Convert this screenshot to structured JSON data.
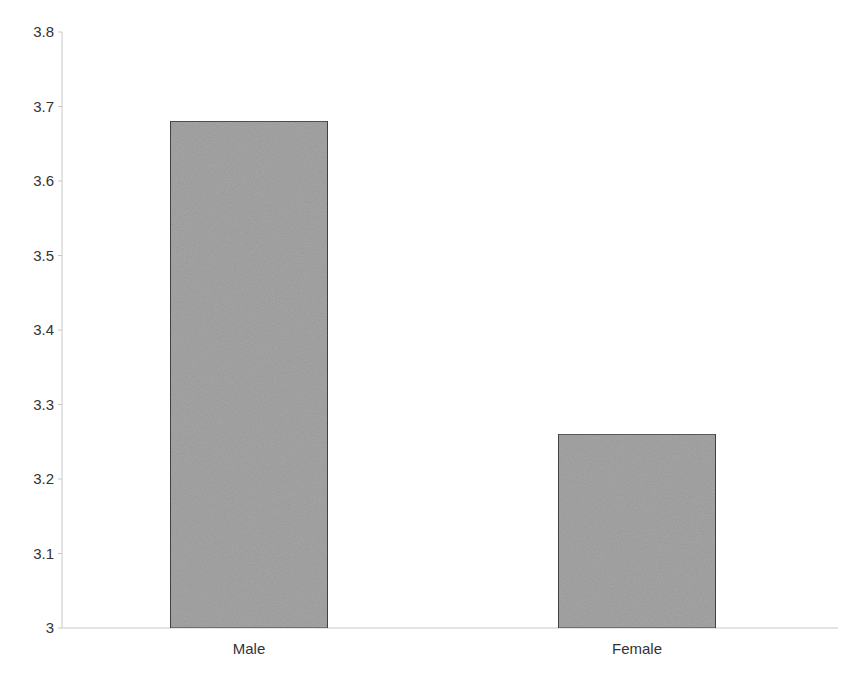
{
  "chart_data": {
    "type": "bar",
    "title": "",
    "xlabel": "",
    "ylabel": "",
    "categories": [
      "Male",
      "Female"
    ],
    "values": [
      3.68,
      3.26
    ],
    "ylim": [
      3,
      3.8
    ],
    "yticks": [
      "3",
      "3.1",
      "3.2",
      "3.3",
      "3.4",
      "3.5",
      "3.6",
      "3.7",
      "3.8"
    ],
    "grid": false,
    "legend": null,
    "bar_color": "#a6a6a6",
    "bar_edge_color": "#444444"
  }
}
